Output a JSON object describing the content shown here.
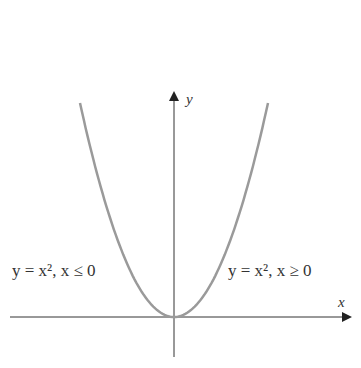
{
  "chart_data": {
    "type": "line",
    "title": "",
    "xlabel": "x",
    "ylabel": "y",
    "series": [
      {
        "name": "y = x², x ≤ 0",
        "function": "x^2",
        "domain": "x<=0"
      },
      {
        "name": "y = x², x ≥ 0",
        "function": "x^2",
        "domain": "x>=0"
      }
    ],
    "annotations": [
      "y = x², x ≤ 0",
      "y = x², x ≥ 0"
    ],
    "grid": false,
    "curve_color": "#999999",
    "axis_color": "#222222"
  },
  "labels": {
    "left": "y = x², x ≤ 0",
    "right": "y = x², x ≥ 0",
    "x_axis": "x",
    "y_axis": "y"
  }
}
